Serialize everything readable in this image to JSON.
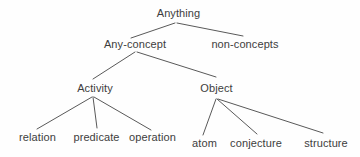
{
  "diagram": {
    "type": "tree",
    "colors": {
      "background": "#fefefe",
      "text": "#3d3d3d",
      "line": "#595959"
    },
    "nodes": [
      {
        "id": "anything",
        "label": "Anything"
      },
      {
        "id": "any-concept",
        "label": "Any-concept"
      },
      {
        "id": "non-concepts",
        "label": "non-concepts"
      },
      {
        "id": "activity",
        "label": "Activity"
      },
      {
        "id": "object",
        "label": "Object"
      },
      {
        "id": "relation",
        "label": "relation"
      },
      {
        "id": "predicate",
        "label": "predicate"
      },
      {
        "id": "operation",
        "label": "operation"
      },
      {
        "id": "atom",
        "label": "atom"
      },
      {
        "id": "conjecture",
        "label": "conjecture"
      },
      {
        "id": "structure",
        "label": "structure"
      }
    ],
    "edges": [
      {
        "from": "Anything",
        "to": "Any-concept"
      },
      {
        "from": "Anything",
        "to": "non-concepts"
      },
      {
        "from": "Any-concept",
        "to": "Activity"
      },
      {
        "from": "Any-concept",
        "to": "Object"
      },
      {
        "from": "Activity",
        "to": "relation"
      },
      {
        "from": "Activity",
        "to": "predicate"
      },
      {
        "from": "Activity",
        "to": "operation"
      },
      {
        "from": "Object",
        "to": "atom"
      },
      {
        "from": "Object",
        "to": "conjecture"
      },
      {
        "from": "Object",
        "to": "structure"
      }
    ]
  }
}
